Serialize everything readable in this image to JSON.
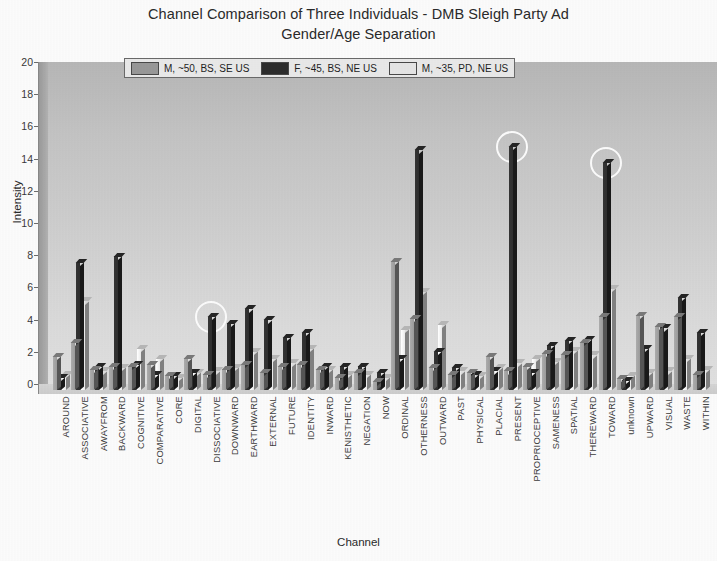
{
  "chart_data": {
    "type": "bar",
    "title": "Channel Comparison of Three Individuals - DMB Sleigh Party Ad",
    "subtitle": "Gender/Age Separation",
    "xlabel": "Channel",
    "ylabel": "Intensity",
    "ylim": [
      0,
      20
    ],
    "ytick_step": 2,
    "yticks": [
      "20",
      "18",
      "16",
      "14",
      "12",
      "10",
      "8",
      "6",
      "4",
      "2",
      "0"
    ],
    "grid": false,
    "legend_position": "top-center",
    "categories": [
      "AROUND",
      "ASSOCIATIVE",
      "AWAYFROM",
      "BACKWARD",
      "COGNITIVE",
      "COMPARATIVE",
      "CORE",
      "DIGITAL",
      "DISSOCIATIVE",
      "DOWNWARD",
      "EARTHWARD",
      "EXTERNAL",
      "FUTURE",
      "IDENTITY",
      "INWARD",
      "KENISTHETIC",
      "NEGATION",
      "NOW",
      "ORDINAL",
      "OTHERNESS",
      "OUTWARD",
      "PAST",
      "PHYSICAL",
      "PLACIAL",
      "PRESENT",
      "PROPRIOCEPTIVE",
      "SAMENESS",
      "SPATIAL",
      "THEREWARD",
      "TOWARD",
      "unknown",
      "UPWARD",
      "VISUAL",
      "WASTE",
      "WITHIN"
    ],
    "series": [
      {
        "name": "M, ~50, BS, SE US",
        "color": "#9a9a9a",
        "values": [
          2.1,
          3.0,
          1.3,
          1.5,
          1.5,
          1.6,
          0.9,
          2.0,
          1.0,
          1.3,
          1.6,
          1.1,
          1.5,
          1.6,
          1.3,
          0.8,
          1.1,
          0.5,
          8.1,
          4.5,
          1.4,
          1.0,
          1.1,
          2.1,
          1.2,
          1.5,
          2.3,
          2.2,
          3.0,
          4.6,
          0.7,
          4.7,
          4.0,
          4.6,
          1.0
        ]
      },
      {
        "name": "F, ~45, BS, NE US",
        "color": "#2e2e2e",
        "values": [
          0.8,
          8.0,
          1.5,
          8.4,
          1.6,
          1.0,
          0.9,
          1.1,
          4.6,
          4.2,
          5.1,
          4.4,
          3.3,
          3.6,
          1.5,
          1.5,
          1.5,
          1.1,
          2.0,
          15.1,
          2.4,
          1.4,
          1.0,
          1.2,
          15.3,
          1.1,
          2.8,
          3.1,
          3.2,
          14.3,
          0.6,
          2.6,
          3.9,
          5.8,
          3.6
        ]
      },
      {
        "name": "M, ~35, PD, NE US",
        "color": "#e8e8e8",
        "values": [
          1.0,
          5.6,
          1.2,
          1.4,
          2.6,
          2.0,
          0.8,
          1.1,
          1.2,
          1.4,
          2.4,
          2.0,
          1.7,
          2.6,
          1.3,
          1.0,
          1.0,
          0.8,
          3.8,
          6.2,
          4.1,
          1.2,
          0.9,
          1.4,
          1.7,
          2.0,
          1.8,
          2.5,
          2.2,
          6.4,
          0.9,
          1.1,
          1.2,
          2.0,
          1.3
        ]
      }
    ],
    "annotations": [
      {
        "name": "highlight-dissociative",
        "x_category": "DISSOCIATIVE",
        "shape": "circle"
      },
      {
        "name": "highlight-present",
        "x_category": "PRESENT",
        "shape": "circle"
      },
      {
        "name": "highlight-toward",
        "x_category": "TOWARD",
        "shape": "circle"
      }
    ]
  },
  "legend": {
    "entries": [
      {
        "label": "M, ~50, BS, SE US",
        "color": "#9a9a9a"
      },
      {
        "label": "F, ~45, BS, NE US",
        "color": "#2e2e2e"
      },
      {
        "label": "M, ~35, PD, NE US",
        "color": "#e8e8e8"
      }
    ]
  },
  "colors": {
    "plot_background_top": "#b9b9b9",
    "plot_background_bottom": "#e4e4e4",
    "axis": "#6e6e6e",
    "text": "#2b2b2b",
    "annotation": "#ffffff"
  }
}
